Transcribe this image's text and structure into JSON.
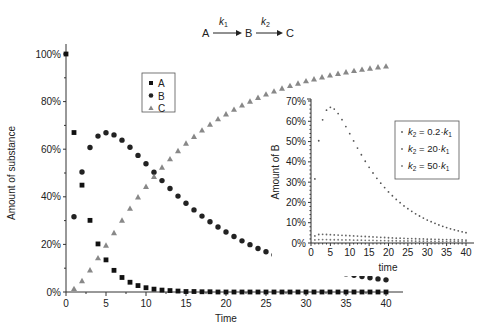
{
  "reaction": {
    "species": [
      "A",
      "B",
      "C"
    ],
    "k1_label": "k",
    "k1_sub": "1",
    "k2_label": "k",
    "k2_sub": "2"
  },
  "chart_data": [
    {
      "type": "scatter",
      "title": "A → B → C (k1, k2)",
      "xlabel": "Time",
      "ylabel": "Amount of substance",
      "xlim": [
        0,
        40
      ],
      "ylim": [
        0,
        100
      ],
      "xticks": [
        "0",
        "5",
        "10",
        "15",
        "20",
        "25",
        "30",
        "35",
        "40"
      ],
      "yticks": [
        "0%",
        "20%",
        "40%",
        "60%",
        "80%",
        "100%"
      ],
      "grid": false,
      "legend_position": "upper-left-inside",
      "x": [
        0,
        1,
        2,
        3,
        4,
        5,
        6,
        7,
        8,
        9,
        10,
        11,
        12,
        13,
        14,
        15,
        16,
        17,
        18,
        19,
        20,
        21,
        22,
        23,
        24,
        25,
        26,
        27,
        28,
        29,
        30,
        31,
        32,
        33,
        34,
        35,
        36,
        37,
        38,
        39,
        40
      ],
      "series": [
        {
          "name": "A",
          "marker": "square",
          "color": "#111111",
          "values": [
            100,
            67.0,
            44.9,
            30.1,
            20.2,
            13.5,
            9.1,
            6.1,
            4.1,
            2.7,
            1.8,
            1.2,
            0.8,
            0.6,
            0.4,
            0.2,
            0.2,
            0.1,
            0.1,
            0,
            0,
            0,
            0,
            0,
            0,
            0,
            0,
            0,
            0,
            0,
            0,
            0,
            0,
            0,
            0,
            0,
            0,
            0,
            0,
            0,
            0
          ]
        },
        {
          "name": "B",
          "marker": "circle",
          "color": "#222222",
          "values": [
            0,
            31.6,
            50.4,
            60.7,
            65.5,
            66.9,
            66.0,
            63.8,
            60.8,
            57.4,
            53.9,
            50.3,
            46.8,
            43.5,
            40.3,
            37.3,
            34.5,
            31.9,
            29.5,
            27.3,
            25.2,
            23.3,
            21.5,
            19.9,
            18.3,
            16.9,
            15.6,
            14.4,
            13.3,
            12.3,
            11.3,
            10.5,
            9.7,
            8.9,
            8.2,
            7.6,
            7.0,
            6.5,
            6.0,
            5.5,
            5.1
          ]
        },
        {
          "name": "C",
          "marker": "triangle",
          "color": "#888888",
          "values": [
            0,
            1.4,
            4.7,
            9.2,
            14.3,
            19.6,
            24.9,
            30.1,
            35.1,
            39.9,
            44.3,
            48.5,
            52.4,
            55.9,
            59.3,
            62.5,
            65.3,
            68.0,
            70.4,
            72.7,
            74.8,
            76.7,
            78.5,
            80.1,
            81.7,
            83.1,
            84.4,
            85.6,
            86.7,
            87.7,
            88.7,
            89.5,
            90.3,
            91.1,
            91.8,
            92.4,
            93.0,
            93.5,
            94.0,
            94.5,
            94.9
          ]
        }
      ]
    },
    {
      "type": "scatter",
      "title": "",
      "xlabel": "time",
      "ylabel": "Amount of B",
      "xlim": [
        0,
        40
      ],
      "ylim": [
        0,
        70
      ],
      "xticks": [
        "0",
        "5",
        "10",
        "15",
        "20",
        "25",
        "30",
        "35",
        "40"
      ],
      "yticks": [
        "0%",
        "10%",
        "20%",
        "30%",
        "40%",
        "50%",
        "60%",
        "70%"
      ],
      "grid": false,
      "legend_position": "right-inside",
      "x": [
        0,
        1,
        2,
        3,
        4,
        5,
        6,
        7,
        8,
        9,
        10,
        11,
        12,
        13,
        14,
        15,
        16,
        17,
        18,
        19,
        20,
        21,
        22,
        23,
        24,
        25,
        26,
        27,
        28,
        29,
        30,
        31,
        32,
        33,
        34,
        35,
        36,
        37,
        38,
        39,
        40
      ],
      "series": [
        {
          "name": "k2 = 0.2·k1",
          "legend_main": "k",
          "legend_sub": "2",
          "legend_rest": " = 0.2·k",
          "legend_sub2": "1",
          "color": "#555555",
          "values": [
            0,
            31.6,
            50.4,
            60.7,
            65.5,
            66.9,
            66.0,
            63.8,
            60.8,
            57.4,
            53.9,
            50.3,
            46.8,
            43.5,
            40.3,
            37.3,
            34.5,
            31.9,
            29.5,
            27.3,
            25.2,
            23.3,
            21.5,
            19.9,
            18.3,
            16.9,
            15.6,
            14.4,
            13.3,
            12.3,
            11.3,
            10.5,
            9.7,
            8.9,
            8.2,
            7.6,
            7.0,
            6.5,
            6.0,
            5.5,
            5.1
          ]
        },
        {
          "name": "k2 = 20·k1",
          "legend_main": "k",
          "legend_sub": "2",
          "legend_rest": " = 20·k",
          "legend_sub2": "1",
          "color": "#666666",
          "values": [
            0,
            3.5,
            4.2,
            4.3,
            4.2,
            4.1,
            4.0,
            3.9,
            3.8,
            3.7,
            3.6,
            3.5,
            3.4,
            3.3,
            3.2,
            3.1,
            3.0,
            2.9,
            2.8,
            2.7,
            2.6,
            2.5,
            2.4,
            2.4,
            2.3,
            2.2,
            2.2,
            2.1,
            2.0,
            2.0,
            1.9,
            1.9,
            1.8,
            1.8,
            1.7,
            1.7,
            1.6,
            1.6,
            1.5,
            1.5,
            1.4
          ]
        },
        {
          "name": "k2 = 50·k1",
          "legend_main": "k",
          "legend_sub": "2",
          "legend_rest": " = 50·k",
          "legend_sub2": "1",
          "color": "#777777",
          "values": [
            0,
            1.5,
            1.7,
            1.7,
            1.7,
            1.6,
            1.6,
            1.6,
            1.5,
            1.5,
            1.5,
            1.4,
            1.4,
            1.4,
            1.3,
            1.3,
            1.3,
            1.2,
            1.2,
            1.2,
            1.1,
            1.1,
            1.1,
            1.0,
            1.0,
            1.0,
            1.0,
            0.9,
            0.9,
            0.9,
            0.9,
            0.8,
            0.8,
            0.8,
            0.8,
            0.7,
            0.7,
            0.7,
            0.7,
            0.6,
            0.6
          ]
        }
      ]
    }
  ]
}
